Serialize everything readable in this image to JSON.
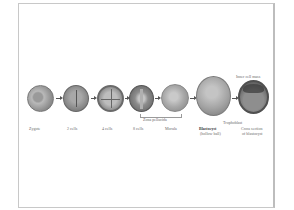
{
  "diagram": {
    "title": "",
    "stages": [
      {
        "id": "zygote",
        "label": "Zygote"
      },
      {
        "id": "2cells",
        "label": "2 cells"
      },
      {
        "id": "4cells",
        "label": "4 cells"
      },
      {
        "id": "8cells",
        "label": "8 cells"
      },
      {
        "id": "morula",
        "label": "Morula"
      },
      {
        "id": "blastocyst",
        "label": "Blastocyst",
        "sublabel": "(hollow ball)"
      },
      {
        "id": "cross-section",
        "label": "Cross section",
        "sublabel": "of blastocyst"
      }
    ],
    "annotations": {
      "zona_pellucida": "Zona pellucida",
      "inner_cell_mass": "Inner cell mass",
      "trophoblast": "Trophoblast"
    },
    "colors": {
      "cell_dark": "#5e5e5e",
      "cell_light": "#c4c4c4",
      "label": "#6a6a6a",
      "frame": "#c8c8c8"
    }
  }
}
